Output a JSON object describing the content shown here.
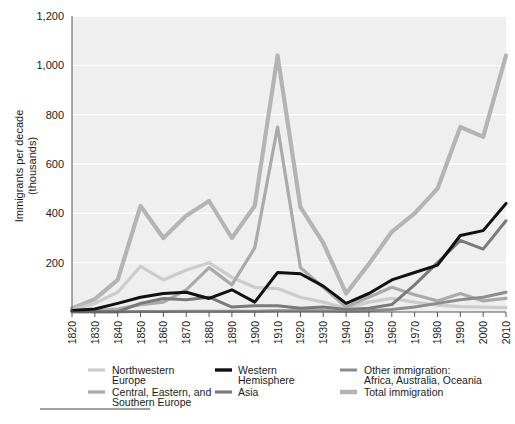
{
  "chart_data": {
    "type": "line",
    "title": "",
    "xlabel": "",
    "ylabel": "Immigrants per decade (thousands)",
    "ylabel_line1": "Immigrants per decade",
    "ylabel_line2": "(thousands)",
    "grid": true,
    "legend_position": "bottom",
    "xlim": [
      1820,
      2010
    ],
    "ylim": [
      0,
      1200
    ],
    "ytick_labels": [
      "1,200",
      "1,000",
      "800",
      "600",
      "400",
      "200"
    ],
    "ytick_values": [
      1200,
      1000,
      800,
      600,
      400,
      200
    ],
    "x": [
      1820,
      1830,
      1840,
      1850,
      1860,
      1870,
      1880,
      1890,
      1900,
      1910,
      1920,
      1930,
      1940,
      1950,
      1960,
      1970,
      1980,
      1990,
      2000,
      2010
    ],
    "xtick_labels": [
      "1820",
      "1830",
      "1840",
      "1850",
      "1860",
      "1870",
      "1880",
      "1890",
      "1900",
      "1910",
      "1920",
      "1930",
      "1940",
      "1950",
      "1960",
      "1970",
      "1980",
      "1990",
      "2000",
      "2010"
    ],
    "series": [
      {
        "name": "Northwestern Europe",
        "color": "#cccccc",
        "width": 3.2,
        "values": [
          8,
          35,
          80,
          185,
          130,
          170,
          200,
          140,
          100,
          95,
          60,
          40,
          15,
          40,
          55,
          40,
          28,
          22,
          20,
          18
        ]
      },
      {
        "name": "Central, Eastern, and Southern Europe",
        "color": "#aaaaaa",
        "width": 3.2,
        "values": [
          2,
          5,
          12,
          30,
          40,
          90,
          180,
          110,
          260,
          750,
          180,
          100,
          20,
          60,
          100,
          70,
          45,
          75,
          45,
          55
        ]
      },
      {
        "name": "Western Hemisphere",
        "color": "#111111",
        "width": 3.0,
        "values": [
          6,
          12,
          35,
          60,
          75,
          80,
          55,
          90,
          40,
          160,
          155,
          105,
          35,
          75,
          130,
          160,
          190,
          310,
          330,
          440
        ]
      },
      {
        "name": "Asia",
        "color": "#7a7a7a",
        "width": 3.0,
        "values": [
          1,
          1,
          1,
          35,
          55,
          50,
          60,
          20,
          25,
          25,
          15,
          20,
          10,
          15,
          30,
          110,
          200,
          290,
          255,
          370
        ]
      },
      {
        "name": "Other immigration: Africa, Australia, Oceania",
        "color": "#8c8c8c",
        "width": 3.0,
        "values": [
          1,
          1,
          1,
          2,
          2,
          3,
          3,
          3,
          3,
          5,
          5,
          5,
          3,
          5,
          10,
          20,
          35,
          50,
          60,
          80
        ]
      },
      {
        "name": "Total immigration",
        "color": "#b4b4b4",
        "width": 4.2,
        "values": [
          14,
          52,
          130,
          430,
          300,
          390,
          450,
          300,
          430,
          1040,
          425,
          280,
          75,
          195,
          325,
          400,
          500,
          750,
          710,
          1040
        ]
      }
    ],
    "annotations": {
      "peak_decade": "1910",
      "peak_total": 1040
    }
  },
  "legend": {
    "items": [
      {
        "label_line1": "Northwestern",
        "label_line2": "Europe",
        "swatch_color": "#cccccc",
        "swatch_width": 3.2,
        "column": 1
      },
      {
        "label_line1": "Central, Eastern, and",
        "label_line2": "Southern Europe",
        "swatch_color": "#aaaaaa",
        "swatch_width": 3.2,
        "column": 1
      },
      {
        "label_line1": "Western",
        "label_line2": "Hemisphere",
        "swatch_color": "#111111",
        "swatch_width": 3.4,
        "column": 2
      },
      {
        "label_line1": "Asia",
        "label_line2": "",
        "swatch_color": "#7a7a7a",
        "swatch_width": 3.2,
        "column": 2
      },
      {
        "label_line1": "Other immigration:",
        "label_line2": "Africa, Australia, Oceania",
        "swatch_color": "#8c8c8c",
        "swatch_width": 3.0,
        "column": 3
      },
      {
        "label_line1": "Total immigration",
        "label_line2": "",
        "swatch_color": "#b4b4b4",
        "swatch_width": 4.4,
        "column": 3
      }
    ]
  },
  "colors": {
    "plot_background": "#efefef",
    "gridline": "#ffffff",
    "axis": "#555555",
    "text": "#1b1b1b",
    "page_background": "#ffffff",
    "footnote_rule": "#444444"
  }
}
